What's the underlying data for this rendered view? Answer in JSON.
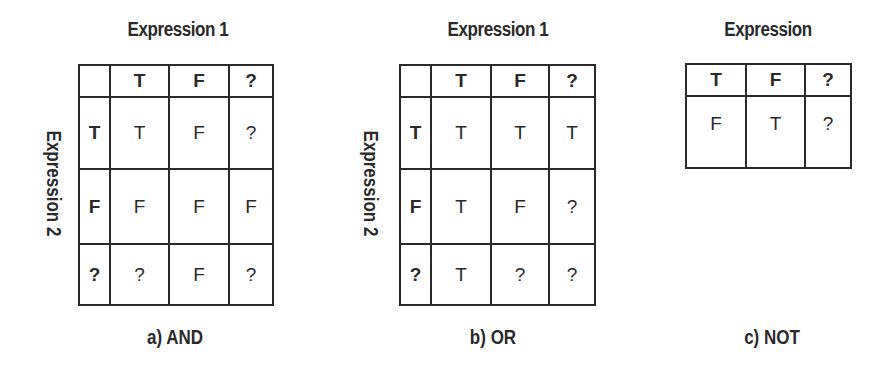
{
  "figures": [
    {
      "id": "and",
      "caption": "a) AND",
      "column_label": "Expression 1",
      "row_label": "Expression 2",
      "column_headers": [
        "T",
        "F",
        "?"
      ],
      "rows": [
        {
          "header": "T",
          "cells": [
            "T",
            "F",
            "?"
          ]
        },
        {
          "header": "F",
          "cells": [
            "F",
            "F",
            "F"
          ]
        },
        {
          "header": "?",
          "cells": [
            "?",
            "F",
            "?"
          ]
        }
      ]
    },
    {
      "id": "or",
      "caption": "b) OR",
      "column_label": "Expression 1",
      "row_label": "Expression 2",
      "column_headers": [
        "T",
        "F",
        "?"
      ],
      "rows": [
        {
          "header": "T",
          "cells": [
            "T",
            "T",
            "T"
          ]
        },
        {
          "header": "F",
          "cells": [
            "T",
            "F",
            "?"
          ]
        },
        {
          "header": "?",
          "cells": [
            "T",
            "?",
            "?"
          ]
        }
      ]
    },
    {
      "id": "not",
      "caption": "c) NOT",
      "column_label": "Expression",
      "column_headers": [
        "T",
        "F",
        "?"
      ],
      "result_row": [
        "F",
        "T",
        "?"
      ]
    }
  ],
  "colors": {
    "line": "#2a2a2a",
    "text": "#2a2a2a",
    "background": "#ffffff"
  }
}
